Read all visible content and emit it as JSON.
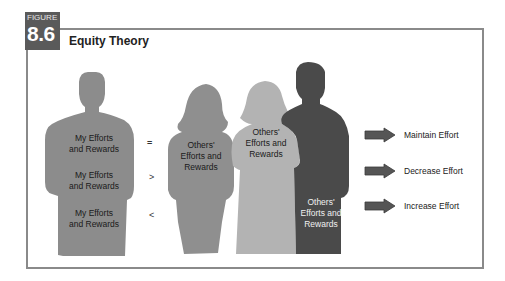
{
  "figure": {
    "label_word": "FIGURE",
    "number": "8.6",
    "title": "Equity Theory"
  },
  "colors": {
    "badge": "#5a5a5a",
    "frame": "#8a8a8a",
    "person_me": "#8c8c8c",
    "person_other1": "#8f8f8f",
    "person_other2": "#b3b3b3",
    "person_other3": "#4a4a4a",
    "arrow": "#555555"
  },
  "me": {
    "labels": [
      {
        "line1": "My Efforts",
        "line2": "and Rewards"
      },
      {
        "line1": "My Efforts",
        "line2": "and Rewards"
      },
      {
        "line1": "My Efforts",
        "line2": "and Rewards"
      }
    ]
  },
  "comparisons": [
    "=",
    ">",
    "<"
  ],
  "others": [
    {
      "line1": "Others'",
      "line2": "Efforts and",
      "line3": "Rewards"
    },
    {
      "line1": "Others'",
      "line2": "Efforts and",
      "line3": "Rewards"
    },
    {
      "line1": "Others'",
      "line2": "Efforts and",
      "line3": "Rewards"
    }
  ],
  "outcomes": [
    {
      "icon": "right-arrow-icon",
      "label": "Maintain Effort"
    },
    {
      "icon": "right-arrow-icon",
      "label": "Decrease Effort"
    },
    {
      "icon": "right-arrow-icon",
      "label": "Increase Effort"
    }
  ]
}
